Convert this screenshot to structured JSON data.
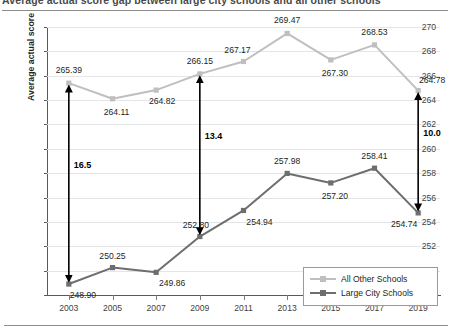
{
  "title": "Average actual score gap between large city schools and all other schools",
  "chart_data": {
    "type": "line",
    "title": "",
    "xlabel": "",
    "ylabel": "Average actual score",
    "ylim": [
      248,
      270
    ],
    "ytick_step": 2,
    "yticks": [
      248,
      250,
      252,
      254,
      256,
      258,
      260,
      262,
      264,
      266,
      268,
      270
    ],
    "grid": true,
    "legend_position": "inside-bottom-right",
    "categories": [
      2003,
      2005,
      2007,
      2009,
      2011,
      2013,
      2015,
      2017,
      2019
    ],
    "xticklabels": [
      "2003",
      "2005",
      "2007",
      "2009",
      "2011",
      "2013",
      "2015",
      "2017",
      "2019"
    ],
    "series": [
      {
        "name": "All Other Schools",
        "color": "#bfbfbf",
        "values": [
          265.39,
          264.11,
          264.82,
          266.15,
          267.17,
          269.47,
          267.3,
          268.53,
          264.78
        ],
        "labels": [
          "265.39",
          "264.11",
          "264.82",
          "266.15",
          "267.17",
          "269.47",
          "267.30",
          "268.53",
          "264.78"
        ]
      },
      {
        "name": "Large City Schools",
        "color": "#6d6e70",
        "values": [
          248.9,
          250.25,
          249.86,
          252.8,
          254.94,
          257.98,
          257.2,
          258.41,
          254.74
        ],
        "labels": [
          "248.90",
          "250.25",
          "249.86",
          "252.80",
          "254.94",
          "257.98",
          "257.20",
          "258.41",
          "254.74"
        ]
      }
    ],
    "annotations": [
      {
        "year": 2003,
        "label": "16.5",
        "top_value": 265.39,
        "bottom_value": 248.9
      },
      {
        "year": 2009,
        "label": "13.4",
        "top_value": 266.15,
        "bottom_value": 252.8
      },
      {
        "year": 2019,
        "label": "10.0",
        "top_value": 264.78,
        "bottom_value": 254.74
      }
    ]
  }
}
